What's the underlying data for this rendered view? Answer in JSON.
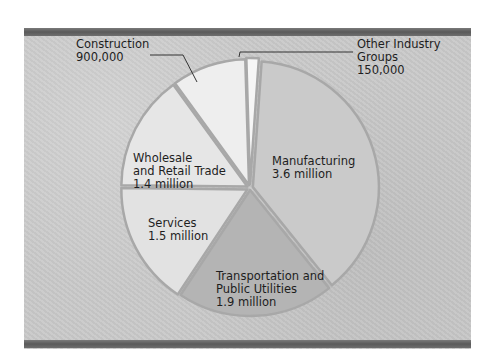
{
  "chart_data": {
    "type": "pie",
    "title": "",
    "units": "workers",
    "start_angle_deg": -86,
    "direction": "clockwise",
    "slices": [
      {
        "name": "Manufacturing",
        "value": 3600000,
        "label_lines": [
          "Manufacturing",
          "3.6 million"
        ],
        "color": "#cacaca"
      },
      {
        "name": "Transportation and Public Utilities",
        "value": 1900000,
        "label_lines": [
          "Transportation and",
          "Public Utilities",
          "1.9 million"
        ],
        "color": "#b4b4b4"
      },
      {
        "name": "Services",
        "value": 1500000,
        "label_lines": [
          "Services",
          "1.5 million"
        ],
        "color": "#e2e2e2"
      },
      {
        "name": "Wholesale and Retail Trade",
        "value": 1400000,
        "label_lines": [
          "Wholesale",
          "and Retail Trade",
          "1.4 million"
        ],
        "color": "#e6e6e6"
      },
      {
        "name": "Construction",
        "value": 900000,
        "label_lines": [
          "Construction",
          "900,000"
        ],
        "color": "#eeeeee",
        "callout": true
      },
      {
        "name": "Other Industry Groups",
        "value": 150000,
        "label_lines": [
          "Other Industry",
          "Groups",
          "150,000"
        ],
        "color": "#f6f6f6",
        "callout": true
      }
    ]
  },
  "colors": {
    "background": "#c9c9c9",
    "frame_bar": "#666666",
    "slice_edge": "#a8a8a8",
    "text": "#1e1e1e"
  }
}
